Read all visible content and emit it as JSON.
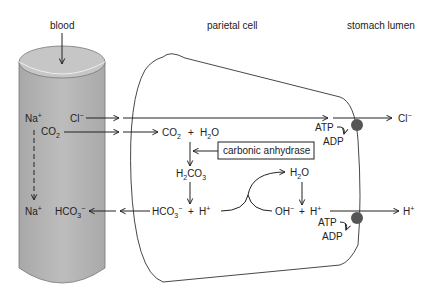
{
  "labels": {
    "blood": "blood",
    "parietal_cell": "parietal cell",
    "stomach_lumen": "stomach lumen",
    "enzyme": "carbonic anhydrase"
  },
  "species": {
    "na_top": {
      "base": "Na",
      "sup": "+"
    },
    "cl_blood": {
      "base": "Cl",
      "sup": "−"
    },
    "co2_blood": {
      "base": "CO",
      "sub": "2"
    },
    "na_bottom": {
      "base": "Na",
      "sup": "+"
    },
    "hco3_blood": {
      "base": "HCO",
      "sub": "3",
      "sup": "−"
    },
    "co2_cell": {
      "base": "CO",
      "sub": "2"
    },
    "plus1": "+",
    "h2o_cell": {
      "pre": "H",
      "sub": "2",
      "post": "O"
    },
    "h2co3": {
      "pre": "H",
      "sub": "2",
      "mid": "CO",
      "sub2": "3"
    },
    "hco3_cell": {
      "base": "HCO",
      "sub": "3",
      "sup": "−"
    },
    "plus2": "+",
    "h_cell": {
      "base": "H",
      "sup": "+"
    },
    "h2o_right": {
      "pre": "H",
      "sub": "2",
      "post": "O"
    },
    "oh": {
      "base": "OH",
      "sup": "−"
    },
    "plus3": "+",
    "h_right": {
      "base": "H",
      "sup": "+"
    },
    "cl_lumen": {
      "base": "Cl",
      "sup": "−"
    },
    "h_lumen": {
      "base": "H",
      "sup": "+"
    },
    "atp_top": "ATP",
    "adp_top": "ADP",
    "atp_bottom": "ATP",
    "adp_bottom": "ADP"
  },
  "colors": {
    "cylinder_fill": "#b5b5b5",
    "cylinder_top": "#c4c4c4",
    "pump": "#555555",
    "line": "#222222"
  }
}
